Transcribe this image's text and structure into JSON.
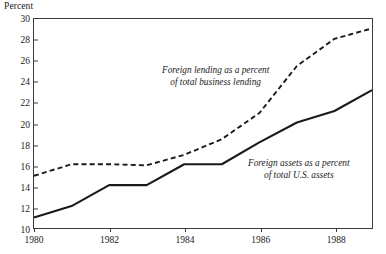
{
  "axis_title": "Percent",
  "annotations": {
    "lending": {
      "line1": "Foreign lending as a percent",
      "line2": "of total business lending"
    },
    "assets": {
      "line1": "Foreign assets as a percent",
      "line2": "of total U.S. assets"
    }
  },
  "chart_data": {
    "type": "line",
    "title": "",
    "xlabel": "",
    "ylabel": "Percent",
    "ylim": [
      10,
      30
    ],
    "xlim": [
      1980,
      1989
    ],
    "ytick_labels": [
      "10",
      "12",
      "14",
      "16",
      "18",
      "20",
      "22",
      "24",
      "26",
      "28",
      "30"
    ],
    "yticks": [
      10,
      12,
      14,
      16,
      18,
      20,
      22,
      24,
      26,
      28,
      30
    ],
    "xtick_labels": [
      "1980",
      "1982",
      "1984",
      "1986",
      "1988"
    ],
    "xticks": [
      1980,
      1982,
      1984,
      1986,
      1988
    ],
    "grid": false,
    "legend": "inline-annotations",
    "x": [
      1980,
      1981,
      1982,
      1983,
      1984,
      1985,
      1986,
      1987,
      1988,
      1989
    ],
    "series": [
      {
        "name": "Foreign lending as a percent of total business lending",
        "style": "dashed",
        "color": "#1a1a1a",
        "values": [
          15.0,
          16.1,
          16.1,
          16.0,
          17.0,
          18.5,
          21.0,
          25.5,
          28.1,
          29.1
        ]
      },
      {
        "name": "Foreign assets as a percent of total U.S. assets",
        "style": "solid",
        "color": "#1a1a1a",
        "values": [
          11.0,
          12.1,
          14.1,
          14.1,
          16.1,
          16.1,
          18.2,
          20.1,
          21.2,
          23.2
        ]
      }
    ]
  }
}
